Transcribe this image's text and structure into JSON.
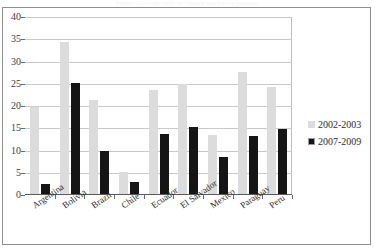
{
  "caption": {
    "text": "Figure: Coverage rates by country and period (percent)"
  },
  "legend": {
    "position": "right",
    "entries": [
      {
        "label": "2002-2003",
        "color": "#dcdcdc",
        "marker": "filled-square"
      },
      {
        "label": "2007-2009",
        "color": "#151515",
        "marker": "outlined-square"
      }
    ]
  },
  "axis": {
    "y_ticks": [
      "0",
      "5",
      "10",
      "15",
      "20",
      "25",
      "30",
      "35",
      "40"
    ]
  },
  "chart_data": {
    "type": "bar",
    "title": "",
    "subtitle": "",
    "xlabel": "",
    "ylabel": "",
    "ylim": [
      0,
      40
    ],
    "ytick_step": 5,
    "grid": true,
    "legend_position": "right",
    "categories": [
      "Argentina",
      "Bolivia",
      "Brazil",
      "Chile",
      "Ecuador",
      "El Salvador",
      "Mexico",
      "Paraguay",
      "Peru"
    ],
    "series": [
      {
        "name": "2002-2003",
        "color": "#dcdcdc",
        "values": [
          19.8,
          34.3,
          21.4,
          5.2,
          23.7,
          25.0,
          13.4,
          27.7,
          24.2
        ]
      },
      {
        "name": "2007-2009",
        "color": "#151515",
        "values": [
          2.5,
          25.2,
          9.9,
          2.9,
          13.7,
          15.2,
          8.5,
          13.2,
          14.8
        ]
      }
    ]
  }
}
